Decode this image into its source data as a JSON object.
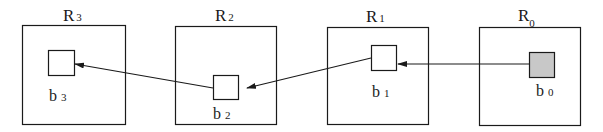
{
  "diagram": {
    "regions": [
      {
        "id": "R3",
        "label": "R",
        "subscript": "3",
        "block": {
          "label": "b",
          "subscript": "3",
          "highlighted": false
        }
      },
      {
        "id": "R2",
        "label": "R",
        "subscript": "2",
        "block": {
          "label": "b",
          "subscript": "2",
          "highlighted": false
        }
      },
      {
        "id": "R1",
        "label": "R",
        "subscript": "1",
        "block": {
          "label": "b",
          "subscript": "1",
          "highlighted": false
        }
      },
      {
        "id": "R0",
        "label": "R",
        "subscript": "0",
        "block": {
          "label": "b",
          "subscript": "0",
          "highlighted": true
        }
      }
    ],
    "edges": [
      {
        "from": "b0",
        "to": "b1"
      },
      {
        "from": "b1",
        "to": "b2"
      },
      {
        "from": "b2",
        "to": "b3"
      }
    ],
    "colors": {
      "stroke": "#1a1a1a",
      "highlight_fill": "#c8c8c8"
    }
  }
}
